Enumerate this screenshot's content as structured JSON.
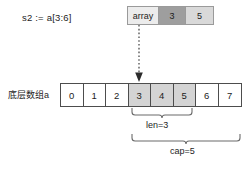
{
  "diagram": {
    "slice_expression": "s2 := a[3:6]",
    "array_label": "底层数组a",
    "colors": {
      "pointer_cell_bg": "#ececec",
      "len_cell_bg": "#9e9e9e",
      "cap_cell_bg": "#d9d9d9",
      "slice_cell_bg": "#d4d4d4",
      "cell_bg": "#ffffff",
      "cell_border": "#4d4d4d",
      "header_border": "#9a9a9a",
      "text": "#242424",
      "background": "#ffffff"
    }
  },
  "slice_header": {
    "cells": [
      {
        "key": "array",
        "label": "array"
      },
      {
        "key": "len",
        "label": "3"
      },
      {
        "key": "cap",
        "label": "5"
      }
    ]
  },
  "array": {
    "cells": [
      {
        "index": 0,
        "label": "0",
        "in_slice": false
      },
      {
        "index": 1,
        "label": "1",
        "in_slice": false
      },
      {
        "index": 2,
        "label": "2",
        "in_slice": false
      },
      {
        "index": 3,
        "label": "3",
        "in_slice": true
      },
      {
        "index": 4,
        "label": "4",
        "in_slice": true
      },
      {
        "index": 5,
        "label": "5",
        "in_slice": true
      },
      {
        "index": 6,
        "label": "6",
        "in_slice": false
      },
      {
        "index": 7,
        "label": "7",
        "in_slice": false
      }
    ]
  },
  "annotations": {
    "len_label": "len=3",
    "cap_label": "cap=5"
  },
  "icons": {
    "pointer_arrow": "dotted-down-arrow-icon",
    "len_brace": "curly-brace-icon",
    "cap_brace": "curly-brace-icon"
  }
}
